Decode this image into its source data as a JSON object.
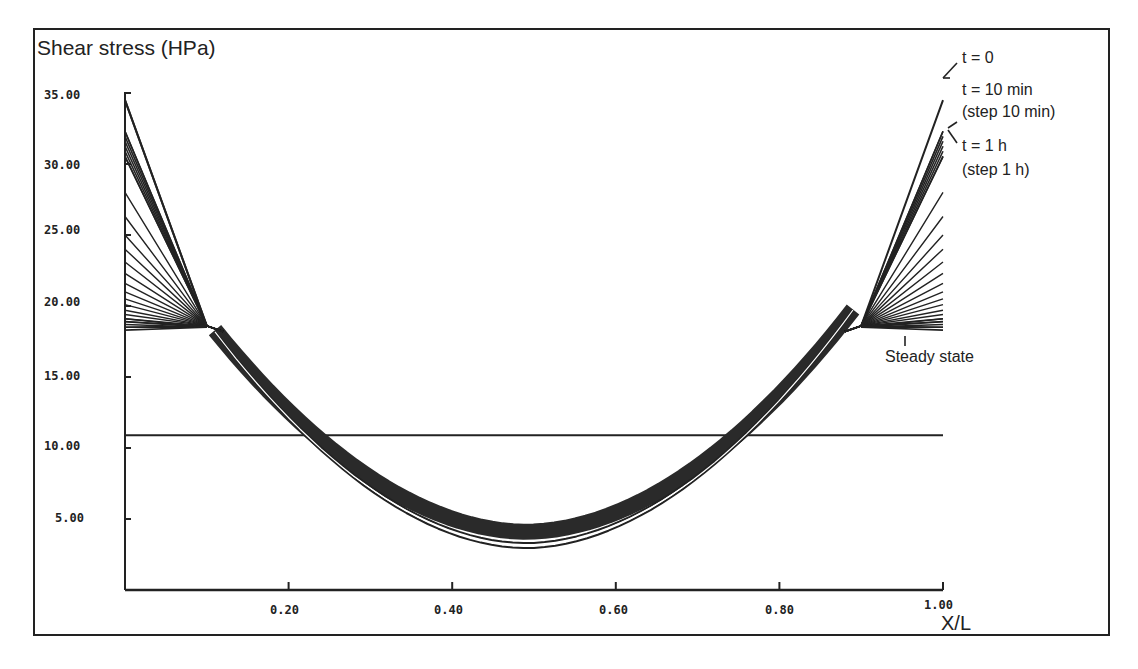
{
  "chart_data": {
    "type": "line",
    "title": "",
    "ylabel": "Shear stress (HPa)",
    "xlabel": "X/L",
    "xlim": [
      0,
      1.0
    ],
    "ylim": [
      0,
      35
    ],
    "grid": false,
    "legend": "annotations on right side",
    "y_ticks": [
      "5.00",
      "10.00",
      "15.00",
      "20.00",
      "25.00",
      "30.00",
      "35.00"
    ],
    "x_ticks": [
      "0.20",
      "0.40",
      "0.60",
      "0.80",
      "1.00"
    ],
    "annotations": [
      {
        "text": "t = 0",
        "points_to": "outermost curve, peak ~34.5 at X/L=0 and 1"
      },
      {
        "text": "t = 10 min",
        "points_to": "curve peaking ~32.3"
      },
      {
        "text": "(step 10 min)",
        "points_to": "dense band of curves 30-32"
      },
      {
        "text": "t = 1 h",
        "points_to": "curve peaking ~30.5"
      },
      {
        "text": "(step 1 h)",
        "points_to": "fan of curves decreasing toward steady state"
      },
      {
        "text": "Steady state",
        "points_to": "flattest curve at ~18.5 near walls"
      }
    ],
    "reference_line": {
      "y": 10.9,
      "x_range": [
        0,
        1.0
      ],
      "description": "horizontal constant line"
    },
    "series": [
      {
        "name": "t = 0",
        "end_value": 34.5,
        "plateau_value": 18.5,
        "min_value": 3.2,
        "min_x": 0.48
      },
      {
        "name": "t = 10 min",
        "end_value": 32.3,
        "plateau_value": 18.5,
        "min_value": 3.5,
        "min_x": 0.48
      },
      {
        "name": "t = 1 h",
        "end_value": 30.5,
        "plateau_value": 18.5,
        "min_value": 3.7,
        "min_x": 0.48
      },
      {
        "name": "t = 2 h",
        "end_value": 28.0
      },
      {
        "name": "t = 3 h",
        "end_value": 26.3
      },
      {
        "name": "t = 4 h",
        "end_value": 25.0
      },
      {
        "name": "t = 5 h",
        "end_value": 24.0
      },
      {
        "name": "t = 6 h",
        "end_value": 23.1
      },
      {
        "name": "t = 7 h",
        "end_value": 22.3
      },
      {
        "name": "t = 8 h",
        "end_value": 21.6
      },
      {
        "name": "t = 9 h",
        "end_value": 21.0
      },
      {
        "name": "t = 10 h",
        "end_value": 20.5
      },
      {
        "name": "t = 11 h",
        "end_value": 20.1
      },
      {
        "name": "t = 12 h",
        "end_value": 19.7
      },
      {
        "name": "t = 13 h",
        "end_value": 19.4
      },
      {
        "name": "t = 14 h",
        "end_value": 19.1
      },
      {
        "name": "t = 15 h",
        "end_value": 18.9
      },
      {
        "name": "Steady state",
        "end_value": 18.5,
        "plateau_value": 18.5,
        "min_value": 3.8,
        "min_x": 0.48
      }
    ],
    "x": [
      0.0,
      0.05,
      0.1,
      0.12,
      0.2,
      0.3,
      0.4,
      0.48,
      0.6,
      0.7,
      0.8,
      0.88,
      0.9,
      0.95,
      1.0
    ],
    "band_profile": {
      "description": "U-shaped shear stress profile; all curves converge near X/L≈0.11 and 0.89 at ~18.5, dip to ~3.5 at X/L≈0.48",
      "values": [
        null,
        null,
        18.5,
        18.0,
        11.5,
        6.0,
        4.0,
        3.6,
        4.6,
        7.5,
        11.5,
        18.0,
        18.5,
        null,
        null
      ]
    }
  },
  "labels": {
    "ylabel": "Shear stress (HPa)",
    "xlabel": "X/L",
    "y_ticks": [
      "35.00",
      "30.00",
      "25.00",
      "20.00",
      "15.00",
      "10.00",
      "5.00"
    ],
    "x_ticks": [
      "0.20",
      "0.40",
      "0.60",
      "0.80",
      "1.00"
    ],
    "ann_t0": "t = 0",
    "ann_t10": "t = 10 min",
    "ann_step10": "(step 10 min)",
    "ann_t1h": "t = 1 h",
    "ann_step1h": "(step 1 h)",
    "ann_steady": "Steady state"
  }
}
